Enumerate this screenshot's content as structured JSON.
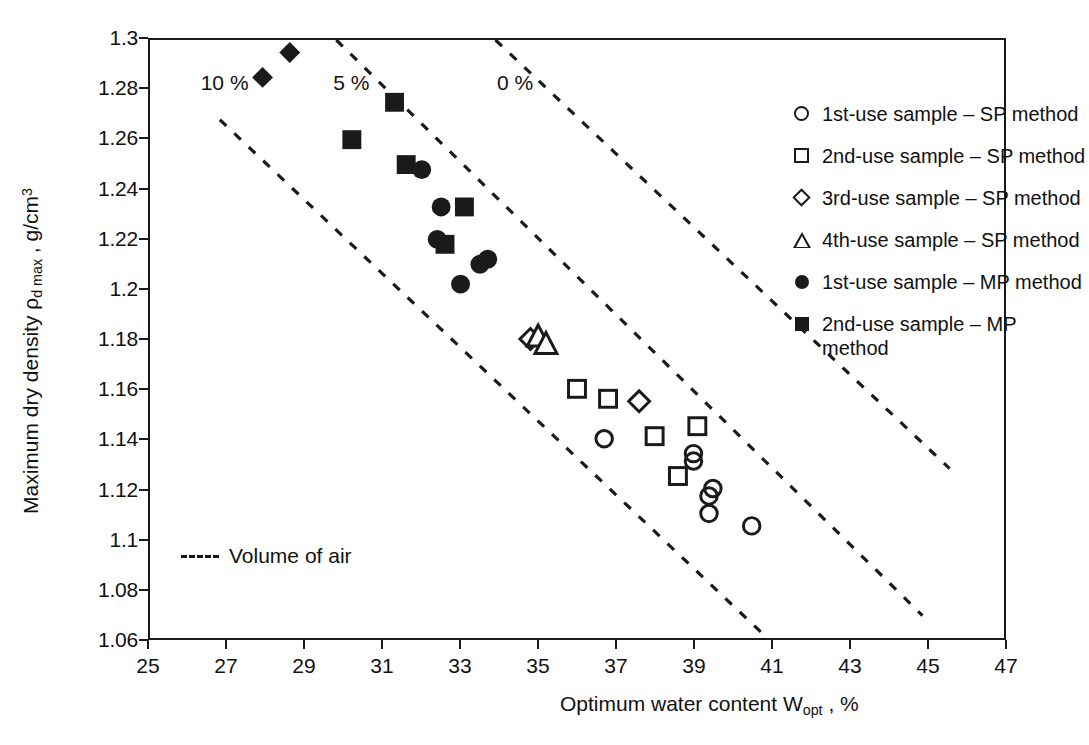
{
  "chart_data": {
    "type": "scatter",
    "title": "",
    "xlabel": "Optimum water content Wopt , %",
    "xlabel_parts": {
      "pre": "Optimum water content W",
      "sub": "opt",
      "post": " ,  %"
    },
    "ylabel": "Maximum dry density ρd max , g/cm3",
    "ylabel_parts": {
      "pre": "Maximum dry density ρ",
      "sub": "d max",
      "mid": " ,  g/cm",
      "sup": "3"
    },
    "xlim": [
      25,
      47
    ],
    "ylim": [
      1.06,
      1.3
    ],
    "xticks": [
      25,
      27,
      29,
      31,
      33,
      35,
      37,
      39,
      41,
      43,
      45,
      47
    ],
    "xtick_labels": [
      "25",
      "27",
      "29",
      "31",
      "33",
      "35",
      "37",
      "39",
      "41",
      "43",
      "45",
      "47"
    ],
    "yticks": [
      1.06,
      1.08,
      1.1,
      1.12,
      1.14,
      1.16,
      1.18,
      1.2,
      1.22,
      1.24,
      1.26,
      1.28,
      1.3
    ],
    "ytick_labels": [
      "1.06",
      "1.08",
      "1.1",
      "1.12",
      "1.14",
      "1.16",
      "1.18",
      "1.2",
      "1.22",
      "1.24",
      "1.26",
      "1.28",
      "1.3"
    ],
    "grid": false,
    "legend_position": "top-right",
    "marker_color": "#1a1a1a",
    "series": [
      {
        "name": "1st-use sample – SP method",
        "marker": "circle-open",
        "points": [
          [
            36.7,
            1.14
          ],
          [
            39.0,
            1.134
          ],
          [
            39.0,
            1.131
          ],
          [
            39.5,
            1.12
          ],
          [
            39.4,
            1.117
          ],
          [
            39.4,
            1.11
          ],
          [
            40.5,
            1.105
          ]
        ]
      },
      {
        "name": "2nd-use sample – SP method",
        "marker": "square-open",
        "points": [
          [
            36.0,
            1.16
          ],
          [
            36.8,
            1.156
          ],
          [
            38.0,
            1.141
          ],
          [
            39.1,
            1.145
          ],
          [
            38.6,
            1.125
          ]
        ]
      },
      {
        "name": "3rd-use sample – SP method",
        "marker": "diamond-open",
        "points": [
          [
            34.8,
            1.18
          ],
          [
            37.6,
            1.155
          ]
        ]
      },
      {
        "name": "4th-use sample – SP method",
        "marker": "triangle-open",
        "points": [
          [
            35.0,
            1.181
          ],
          [
            35.2,
            1.178
          ]
        ]
      },
      {
        "name": "1st-use sample – MP method",
        "marker": "circle-filled",
        "points": [
          [
            32.0,
            1.248
          ],
          [
            32.5,
            1.233
          ],
          [
            32.4,
            1.22
          ],
          [
            33.0,
            1.202
          ],
          [
            33.5,
            1.21
          ],
          [
            33.7,
            1.212
          ]
        ]
      },
      {
        "name": "2nd-use sample – MP method",
        "marker": "square-filled",
        "points": [
          [
            31.3,
            1.275
          ],
          [
            30.2,
            1.26
          ],
          [
            31.6,
            1.25
          ],
          [
            33.1,
            1.233
          ],
          [
            32.6,
            1.218
          ]
        ]
      },
      {
        "name": "3rd-use sample – SP method (upper)",
        "marker": "diamond-filled",
        "points": [
          [
            28.6,
            1.295
          ],
          [
            27.9,
            1.285
          ]
        ]
      }
    ],
    "air_void_lines": [
      {
        "label": "10 %",
        "label_x": 26.3,
        "label_y": 1.282,
        "p1": [
          26.8,
          1.268
        ],
        "p2": [
          40.9,
          1.06
        ]
      },
      {
        "label": "5 %",
        "label_x": 29.7,
        "label_y": 1.282,
        "p1": [
          29.8,
          1.3
        ],
        "p2": [
          44.9,
          1.069
        ]
      },
      {
        "label": "0 %",
        "label_x": 33.9,
        "label_y": 1.282,
        "p1": [
          33.9,
          1.3
        ],
        "p2": [
          45.6,
          1.128
        ]
      }
    ],
    "annotations": [
      {
        "name": "volume-of-air-key",
        "text": "Volume of air",
        "style": "dashed-line-swatch"
      }
    ]
  },
  "legend": {
    "items": [
      {
        "marker": "circle-open",
        "label": "1st-use sample – SP method"
      },
      {
        "marker": "square-open",
        "label": "2nd-use sample – SP method"
      },
      {
        "marker": "diamond-open",
        "label": "3rd-use sample – SP method"
      },
      {
        "marker": "triangle-open",
        "label": "4th-use sample – SP method"
      },
      {
        "marker": "circle-filled",
        "label": "1st-use sample – MP method"
      },
      {
        "marker": "square-filled",
        "label": "2nd-use sample – MP\nmethod"
      }
    ]
  },
  "keys": {
    "volume_of_air": "Volume of air"
  }
}
